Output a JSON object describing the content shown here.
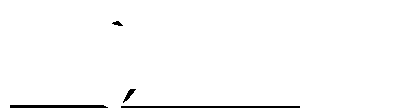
{
  "image": {
    "subject": "stippled twisted ribbon",
    "width": 395,
    "height": 112,
    "background": "#ffffff",
    "ink": "#000000"
  }
}
